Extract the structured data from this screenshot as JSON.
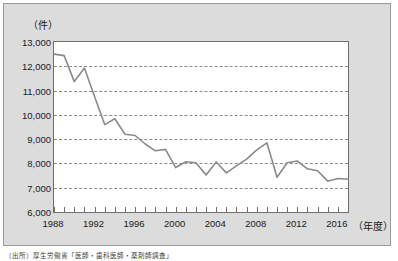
{
  "figure": {
    "unit_label": "（件）",
    "x_axis_title": "（年度）",
    "source_note": "（出所）厚生労働省「医師・歯科医師・薬剤師調査」"
  },
  "colors": {
    "page_background": "#ffffff",
    "figure_background": "#dcdcdc",
    "plot_background": "#ffffff",
    "plot_border": "#6e6e6e",
    "gridline": "#8c8c8c",
    "series_line": "#8a8a8a",
    "text": "#1a1a1a"
  },
  "chart_data": {
    "type": "line",
    "title": "",
    "xlabel": "（年度）",
    "ylabel": "（件）",
    "xlim": [
      1988,
      2017
    ],
    "ylim": [
      6000,
      13000
    ],
    "ytick_step": 1000,
    "grid": true,
    "legend": false,
    "yticks": [
      6000,
      7000,
      8000,
      9000,
      10000,
      11000,
      12000,
      13000
    ],
    "ytick_labels": [
      "6,000",
      "7,000",
      "8,000",
      "9,000",
      "10,000",
      "11,000",
      "12,000",
      "13,000"
    ],
    "xticks_major": [
      1988,
      1992,
      1996,
      2000,
      2004,
      2008,
      2012,
      2016
    ],
    "xtick_labels": [
      "1988",
      "1992",
      "1996",
      "2000",
      "2004",
      "2008",
      "2012",
      "2016"
    ],
    "xticks_minor_every": 1,
    "x": [
      1988,
      1989,
      1990,
      1991,
      1992,
      1993,
      1994,
      1995,
      1996,
      1997,
      1998,
      1999,
      2000,
      2001,
      2002,
      2003,
      2004,
      2005,
      2006,
      2007,
      2008,
      2009,
      2010,
      2011,
      2012,
      2013,
      2014,
      2015,
      2016,
      2017
    ],
    "values": [
      12500,
      12440,
      11370,
      11930,
      10760,
      9600,
      9840,
      9200,
      9150,
      8800,
      8520,
      8580,
      7830,
      8070,
      8030,
      7520,
      8060,
      7610,
      7900,
      8180,
      8560,
      8850,
      7430,
      8030,
      8100,
      7780,
      7700,
      7270,
      7380,
      7350
    ],
    "series": [
      {
        "name": "件数",
        "values": [
          12500,
          12440,
          11370,
          11930,
          10760,
          9600,
          9840,
          9200,
          9150,
          8800,
          8520,
          8580,
          7830,
          8070,
          8030,
          7520,
          8060,
          7610,
          7900,
          8180,
          8560,
          8850,
          7430,
          8030,
          8100,
          7780,
          7700,
          7270,
          7380,
          7350
        ]
      }
    ]
  }
}
